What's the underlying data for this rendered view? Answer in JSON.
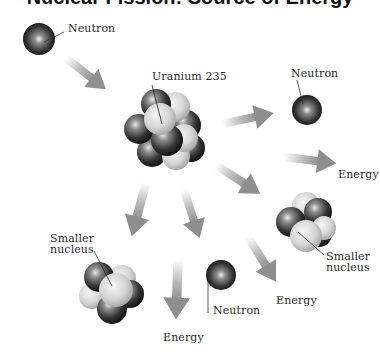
{
  "title_partial": "Nuclear Fission: Source of Energy",
  "labels": {
    "incoming_neutron": "Neutron",
    "uranium": "Uranium 235",
    "neutron_top_right": "Neutron",
    "energy_right": "Energy",
    "smaller_nucleus_right_line1": "Smaller",
    "smaller_nucleus_right_line2": "nucleus",
    "smaller_nucleus_left_line1": "Smaller",
    "smaller_nucleus_left_line2": "nucleus",
    "neutron_bottom": "Neutron",
    "energy_bottom_mid": "Energy",
    "energy_bottom_left": "Energy"
  },
  "colors": {
    "neutron_dark": "#1e1e1e",
    "proton_light": "#d4d4d4",
    "arrow": "#9a9a9a",
    "leader_line": "#333333"
  }
}
